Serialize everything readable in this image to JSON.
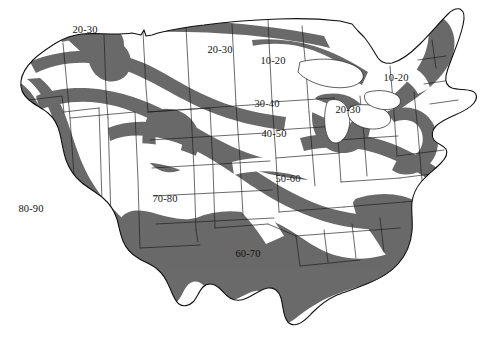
{
  "figure": {
    "name": "united-states-contour-band-map",
    "width": 499,
    "height": 347,
    "background_color": "#ffffff"
  },
  "style": {
    "shaded_fill": "#6a6a6a",
    "unshaded_fill": "#ffffff",
    "outline_color": "#111111",
    "state_border_color": "#1a1a1a",
    "label_color": "#1a1a1a"
  },
  "chart_data": {
    "type": "map",
    "title": "",
    "subtitle": "",
    "xlabel": "",
    "ylabel": "",
    "legend_position": "none",
    "grid": false,
    "band_scheme": "alternating shaded / unshaded isopleth bands",
    "units": "",
    "bands": [
      {
        "id": "band-10-20-north-central",
        "label": "10-20",
        "value_min": 10,
        "value_max": 20,
        "shaded": false,
        "region": "Minnesota / Upper Midwest",
        "x": 273,
        "y": 61
      },
      {
        "id": "band-10-20-northeast",
        "label": "10-20",
        "value_min": 10,
        "value_max": 20,
        "shaded": false,
        "region": "Upstate New York / Northern New England",
        "x": 396,
        "y": 78
      },
      {
        "id": "band-20-30-northwest",
        "label": "20-30",
        "value_min": 20,
        "value_max": 30,
        "shaded": true,
        "region": "Northern Washington",
        "x": 85,
        "y": 30
      },
      {
        "id": "band-20-30-northern-plains",
        "label": "20-30",
        "value_min": 20,
        "value_max": 30,
        "shaded": true,
        "region": "North Dakota / Northern Plains",
        "x": 220,
        "y": 50
      },
      {
        "id": "band-20-30-great-lakes",
        "label": "20-30",
        "value_min": 20,
        "value_max": 30,
        "shaded": true,
        "region": "Lower Michigan / Great Lakes",
        "x": 348,
        "y": 110
      },
      {
        "id": "band-30-40",
        "label": "30-40",
        "value_min": 30,
        "value_max": 40,
        "shaded": false,
        "region": "South Dakota / Nebraska",
        "x": 267,
        "y": 104
      },
      {
        "id": "band-40-50",
        "label": "40-50",
        "value_min": 40,
        "value_max": 50,
        "shaded": true,
        "region": "Nebraska / Iowa",
        "x": 274,
        "y": 134
      },
      {
        "id": "band-50-60",
        "label": "50-60",
        "value_min": 50,
        "value_max": 60,
        "shaded": false,
        "region": "Kansas / Missouri",
        "x": 288,
        "y": 179
      },
      {
        "id": "band-60-70",
        "label": "60-70",
        "value_min": 60,
        "value_max": 70,
        "shaded": true,
        "region": "Texas / Gulf Coast / Southeast",
        "x": 248,
        "y": 254
      },
      {
        "id": "band-70-80",
        "label": "70-80",
        "value_min": 70,
        "value_max": 80,
        "shaded": false,
        "region": "Southwest interior / Colorado Plateau",
        "x": 165,
        "y": 199
      },
      {
        "id": "band-80-90",
        "label": "80-90",
        "value_min": 80,
        "value_max": 90,
        "shaded": true,
        "region": "Southern California coast",
        "x": 31,
        "y": 209
      }
    ],
    "value_range": [
      10,
      90
    ],
    "band_step": 10
  }
}
